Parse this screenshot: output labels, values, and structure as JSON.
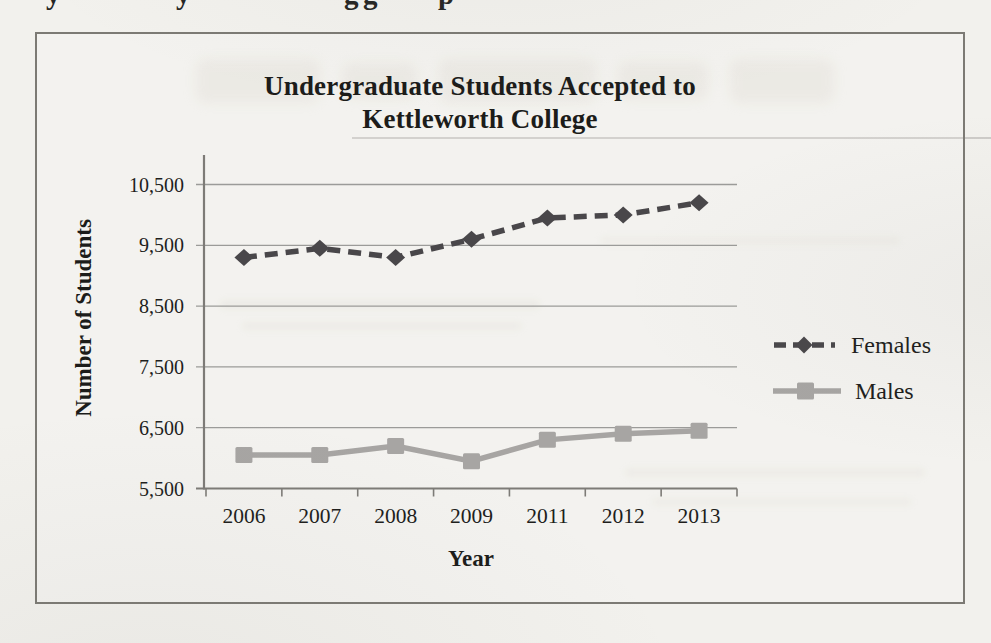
{
  "page": {
    "cropped_text_fragments": [
      {
        "char": "y",
        "x": 46
      },
      {
        "char": "y",
        "x": 176
      },
      {
        "char": "g",
        "x": 344
      },
      {
        "char": "g",
        "x": 363
      },
      {
        "char": "p",
        "x": 438
      }
    ]
  },
  "chart_data": {
    "type": "line",
    "title": "Undergraduate Students Accepted to Kettleworth College",
    "title_lines": [
      "Undergraduate Students Accepted to",
      "Kettleworth College"
    ],
    "xlabel": "Year",
    "ylabel": "Number of Students",
    "categories": [
      "2006",
      "2007",
      "2008",
      "2009",
      "2011",
      "2012",
      "2013"
    ],
    "series": [
      {
        "name": "Females",
        "values": [
          9300,
          9450,
          9300,
          9600,
          9950,
          10000,
          10200
        ],
        "color": "#49474a",
        "marker": "diamond",
        "line_style": "dashed"
      },
      {
        "name": "Males",
        "values": [
          6050,
          6050,
          6200,
          5950,
          6300,
          6400,
          6450
        ],
        "color": "#a7a5a3",
        "marker": "square",
        "line_style": "solid"
      }
    ],
    "ylim": [
      5500,
      10500
    ],
    "ytick_step": 1000,
    "ytick_labels": [
      "5,500",
      "6,500",
      "7,500",
      "8,500",
      "9,500",
      "10,500"
    ],
    "grid": "horizontal gridlines on",
    "legend_position": "right"
  },
  "colors": {
    "paper": "#f2f1ed",
    "frame_border": "#7c7a74",
    "gridline": "#9b9b99",
    "axis": "#7d7b77",
    "text": "#1e1e1c",
    "females_series": "#49474a",
    "males_series": "#a7a5a3"
  }
}
